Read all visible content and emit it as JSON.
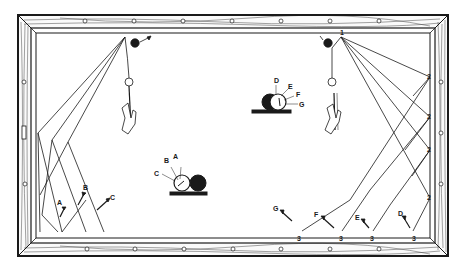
{
  "diagram": {
    "colors": {
      "ink": "#1a1a1a",
      "felt": "#ffffff",
      "wood_light": "#f2f2f2"
    },
    "left_shot": {
      "cue_ball_contact_labels": [
        "A",
        "B",
        "C"
      ],
      "end_arrow_labels": [
        "A",
        "B",
        "C"
      ]
    },
    "right_shot": {
      "origin_label": "1",
      "cue_ball_contact_labels": [
        "D",
        "E",
        "F",
        "G"
      ],
      "side_cushion_labels": [
        "2",
        "2",
        "2",
        "2"
      ],
      "bottom_cushion_labels": [
        "3",
        "3",
        "3",
        "3"
      ],
      "end_arrow_labels": [
        "G",
        "F",
        "E",
        "D"
      ]
    }
  }
}
